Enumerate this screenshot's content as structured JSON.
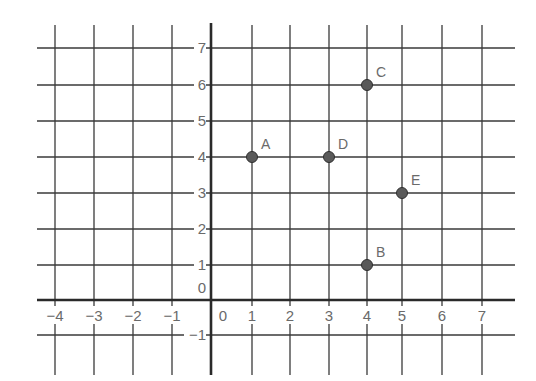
{
  "chart_data": {
    "type": "scatter",
    "title": "",
    "xlabel": "",
    "ylabel": "",
    "xlim": [
      -4,
      7
    ],
    "ylim": [
      -1,
      7
    ],
    "grid": true,
    "x_ticks": [
      -4,
      -3,
      -2,
      -1,
      0,
      1,
      2,
      3,
      4,
      5,
      6,
      7
    ],
    "y_ticks": [
      -1,
      0,
      1,
      2,
      3,
      4,
      5,
      6,
      7
    ],
    "x_tick_labels": [
      "−4",
      "−3",
      "−2",
      "−1",
      "0",
      "1",
      "2",
      "3",
      "4",
      "5",
      "6",
      "7"
    ],
    "y_tick_labels": [
      "−1",
      "0",
      "1",
      "2",
      "3",
      "4",
      "5",
      "6",
      "7"
    ],
    "points": [
      {
        "label": "A",
        "x": 1,
        "y": 4
      },
      {
        "label": "B",
        "x": 4,
        "y": 1
      },
      {
        "label": "C",
        "x": 4,
        "y": 6
      },
      {
        "label": "D",
        "x": 3,
        "y": 4
      },
      {
        "label": "E",
        "x": 5,
        "y": 3
      }
    ]
  },
  "layout": {
    "x_pixels": {
      "-4": 55,
      "-3": 94,
      "-2": 133,
      "-1": 172,
      "0": 211,
      "1": 252,
      "2": 290,
      "3": 329,
      "4": 367,
      "5": 402,
      "6": 442,
      "7": 482
    },
    "y_pixels": {
      "-1": 335,
      "0": 300,
      "1": 265,
      "2": 229,
      "3": 193,
      "4": 157,
      "5": 121,
      "6": 85,
      "7": 48
    },
    "grid_left": 37,
    "grid_right": 515,
    "grid_top": 25,
    "grid_bottom": 375
  },
  "colors": {
    "grid": "#3a3a3a",
    "axis": "#2a2a2a",
    "text": "#6a6a6a",
    "point_fill": "#5a5a5a"
  }
}
